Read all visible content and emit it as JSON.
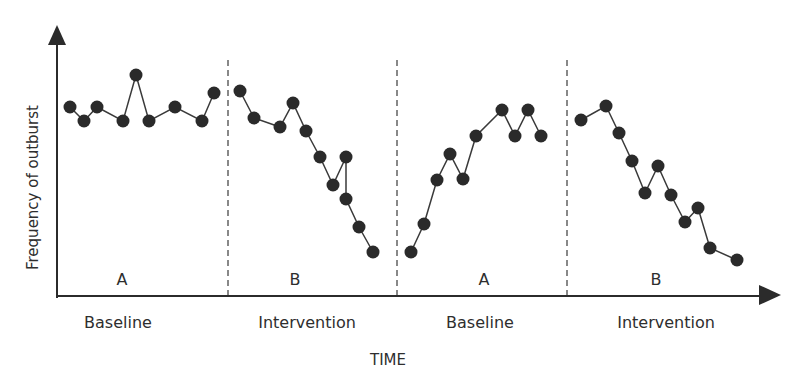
{
  "chart_data": {
    "type": "line",
    "title": "",
    "xlabel": "TIME",
    "ylabel": "Frequency of outburst",
    "grid": false,
    "legend": null,
    "y_ticks_shown": false,
    "x_ticks_shown": false,
    "ylim": [
      0,
      10
    ],
    "note": "No numeric axis ticks shown; values are relative estimates on a 0-10 scale read from point heights.",
    "phases": [
      {
        "letter": "A",
        "name": "Baseline",
        "center_x": 122,
        "name_x": 118
      },
      {
        "letter": "B",
        "name": "Intervention",
        "center_x": 295,
        "name_x": 307
      },
      {
        "letter": "A",
        "name": "Baseline",
        "center_x": 484,
        "name_x": 480
      },
      {
        "letter": "B",
        "name": "Intervention",
        "center_x": 656,
        "name_x": 666
      }
    ],
    "dividers_x": [
      228,
      397,
      567
    ],
    "series": [
      {
        "name": "Baseline A (1)",
        "points_px": [
          [
            70,
            107
          ],
          [
            84,
            121
          ],
          [
            97,
            107
          ],
          [
            123,
            121
          ],
          [
            136,
            75
          ],
          [
            149,
            121
          ],
          [
            175,
            107
          ],
          [
            202,
            121
          ],
          [
            214,
            93
          ]
        ],
        "values": [
          7.5,
          7.0,
          7.5,
          7.0,
          8.8,
          7.0,
          7.5,
          7.0,
          8.1
        ]
      },
      {
        "name": "Intervention B (1)",
        "points_px": [
          [
            240,
            91
          ],
          [
            254,
            118
          ],
          [
            280,
            127
          ],
          [
            293,
            103
          ],
          [
            306,
            131
          ],
          [
            320,
            157
          ],
          [
            333,
            185
          ],
          [
            346,
            157
          ],
          [
            346,
            199
          ],
          [
            359,
            227
          ],
          [
            373,
            252
          ]
        ],
        "values": [
          8.2,
          7.1,
          6.7,
          7.7,
          6.6,
          5.6,
          4.4,
          5.6,
          3.9,
          2.8,
          1.8
        ]
      },
      {
        "name": "Baseline A (2)",
        "points_px": [
          [
            411,
            252
          ],
          [
            424,
            224
          ],
          [
            437,
            180
          ],
          [
            450,
            154
          ],
          [
            463,
            179
          ],
          [
            476,
            136
          ],
          [
            502,
            110
          ],
          [
            515,
            136
          ],
          [
            528,
            110
          ],
          [
            541,
            136
          ]
        ],
        "values": [
          1.8,
          2.9,
          4.6,
          5.7,
          4.7,
          6.4,
          7.4,
          6.4,
          7.4,
          6.4
        ]
      },
      {
        "name": "Intervention B (2)",
        "points_px": [
          [
            581,
            120
          ],
          [
            606,
            106
          ],
          [
            619,
            133
          ],
          [
            632,
            161
          ],
          [
            645,
            193
          ],
          [
            658,
            166
          ],
          [
            671,
            195
          ],
          [
            685,
            222
          ],
          [
            698,
            208
          ],
          [
            710,
            248
          ],
          [
            737,
            260
          ]
        ],
        "values": [
          7.0,
          7.6,
          6.5,
          5.4,
          4.1,
          5.2,
          4.0,
          3.0,
          3.5,
          1.9,
          1.5
        ]
      }
    ],
    "colors": {
      "axis": "#2b2b2b",
      "line": "#3a3a3a",
      "dot": "#2a2a2a",
      "divider": "#3a3a3a",
      "background": "#ffffff"
    }
  },
  "labels": {
    "ylabel": "Frequency of outburst",
    "xlabel": "TIME",
    "phase_letters": [
      "A",
      "B",
      "A",
      "B"
    ],
    "phase_names": [
      "Baseline",
      "Intervention",
      "Baseline",
      "Intervention"
    ]
  }
}
